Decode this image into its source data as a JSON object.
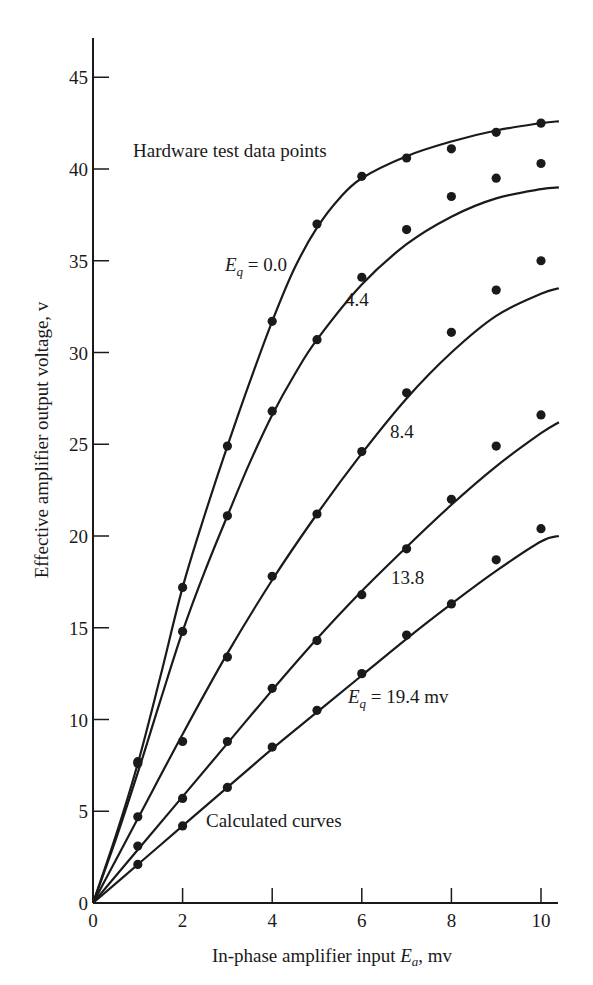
{
  "chart_data": {
    "type": "line",
    "title": "",
    "xlabel": "In-phase amplifier input E_a, mv",
    "xlabel_parts": {
      "pre": "In-phase amplifier input ",
      "var": "E",
      "sub": "a",
      "post": ", mv"
    },
    "ylabel": "Effective amplifier output voltage, v",
    "xlim": [
      0,
      10.4
    ],
    "ylim": [
      0,
      47
    ],
    "x_ticks": [
      0,
      2,
      4,
      6,
      8,
      10
    ],
    "y_ticks": [
      0,
      5,
      10,
      15,
      20,
      25,
      30,
      35,
      40,
      45
    ],
    "grid": false,
    "annotations": [
      {
        "text": "Hardware test data points",
        "x": 133,
        "y": 157
      },
      {
        "text": "Calculated curves",
        "x": 206,
        "y": 827
      }
    ],
    "series": [
      {
        "name": "Eq = 0.0",
        "label": {
          "pre": "E",
          "sub": "q",
          "post": " = 0.0",
          "x": 225,
          "y": 271
        },
        "curve": [
          [
            0,
            0
          ],
          [
            0.5,
            3.6
          ],
          [
            1,
            7.6
          ],
          [
            1.5,
            12.3
          ],
          [
            2,
            17.2
          ],
          [
            2.5,
            21.2
          ],
          [
            3,
            24.9
          ],
          [
            3.5,
            28.4
          ],
          [
            4,
            31.7
          ],
          [
            4.5,
            34.6
          ],
          [
            5,
            36.8
          ],
          [
            5.5,
            38.4
          ],
          [
            6,
            39.5
          ],
          [
            7,
            40.7
          ],
          [
            8,
            41.5
          ],
          [
            9,
            42.1
          ],
          [
            10,
            42.5
          ],
          [
            10.4,
            42.6
          ]
        ],
        "points": [
          [
            1,
            7.7
          ],
          [
            2,
            17.2
          ],
          [
            3,
            24.9
          ],
          [
            4,
            31.7
          ],
          [
            5,
            37.0
          ],
          [
            6,
            39.6
          ],
          [
            7,
            40.6
          ],
          [
            8,
            41.1
          ],
          [
            9,
            42.0
          ],
          [
            10,
            42.5
          ]
        ]
      },
      {
        "name": "Eq = 4.4",
        "label": {
          "pre": "",
          "sub": "",
          "post": "4.4",
          "x": 345,
          "y": 306
        },
        "curve": [
          [
            0,
            0
          ],
          [
            0.5,
            3.4
          ],
          [
            1,
            7.1
          ],
          [
            1.5,
            11.0
          ],
          [
            2,
            14.8
          ],
          [
            2.5,
            18.1
          ],
          [
            3,
            21.1
          ],
          [
            3.5,
            24.0
          ],
          [
            4,
            26.6
          ],
          [
            4.5,
            28.8
          ],
          [
            5,
            30.7
          ],
          [
            6,
            33.7
          ],
          [
            7,
            35.9
          ],
          [
            8,
            37.4
          ],
          [
            9,
            38.4
          ],
          [
            10,
            38.9
          ],
          [
            10.4,
            39.0
          ]
        ],
        "points": [
          [
            1,
            4.7
          ],
          [
            2,
            14.8
          ],
          [
            3,
            21.1
          ],
          [
            4,
            26.8
          ],
          [
            5,
            30.7
          ],
          [
            6,
            34.1
          ],
          [
            7,
            36.7
          ],
          [
            8,
            38.5
          ],
          [
            9,
            39.5
          ],
          [
            10,
            40.3
          ]
        ]
      },
      {
        "name": "Eq = 8.4",
        "label": {
          "pre": "",
          "sub": "",
          "post": "8.4",
          "x": 390,
          "y": 438
        },
        "curve": [
          [
            0,
            0
          ],
          [
            1,
            4.6
          ],
          [
            2,
            9.2
          ],
          [
            3,
            13.6
          ],
          [
            4,
            17.6
          ],
          [
            5,
            21.2
          ],
          [
            6,
            24.5
          ],
          [
            7,
            27.5
          ],
          [
            8,
            30.0
          ],
          [
            9,
            32.0
          ],
          [
            10,
            33.2
          ],
          [
            10.4,
            33.5
          ]
        ],
        "points": [
          [
            1,
            3.1
          ],
          [
            2,
            8.8
          ],
          [
            3,
            13.4
          ],
          [
            4,
            17.8
          ],
          [
            5,
            21.2
          ],
          [
            6,
            24.6
          ],
          [
            7,
            27.8
          ],
          [
            8,
            31.1
          ],
          [
            9,
            33.4
          ],
          [
            10,
            35.0
          ]
        ]
      },
      {
        "name": "Eq = 13.8",
        "label": {
          "pre": "",
          "sub": "",
          "post": "13.8",
          "x": 391,
          "y": 584
        },
        "curve": [
          [
            0,
            0
          ],
          [
            1,
            2.9
          ],
          [
            2,
            5.8
          ],
          [
            3,
            8.7
          ],
          [
            4,
            11.6
          ],
          [
            5,
            14.4
          ],
          [
            6,
            17.0
          ],
          [
            7,
            19.4
          ],
          [
            8,
            21.7
          ],
          [
            9,
            23.8
          ],
          [
            10,
            25.6
          ],
          [
            10.4,
            26.2
          ]
        ],
        "points": [
          [
            1,
            7.6
          ],
          [
            2,
            5.7
          ],
          [
            3,
            8.8
          ],
          [
            4,
            11.7
          ],
          [
            5,
            14.3
          ],
          [
            6,
            16.8
          ],
          [
            7,
            19.3
          ],
          [
            8,
            22.0
          ],
          [
            9,
            24.9
          ],
          [
            10,
            26.6
          ]
        ]
      },
      {
        "name": "Eq = 19.4 mv",
        "label": {
          "pre": "E",
          "sub": "q",
          "post": " = 19.4  mv",
          "x": 348,
          "y": 703
        },
        "curve": [
          [
            0,
            0
          ],
          [
            1,
            2.1
          ],
          [
            2,
            4.2
          ],
          [
            3,
            6.3
          ],
          [
            4,
            8.4
          ],
          [
            5,
            10.4
          ],
          [
            6,
            12.4
          ],
          [
            7,
            14.4
          ],
          [
            8,
            16.3
          ],
          [
            9,
            18.1
          ],
          [
            10,
            19.7
          ],
          [
            10.4,
            20.0
          ]
        ],
        "points": [
          [
            1,
            2.1
          ],
          [
            2,
            4.2
          ],
          [
            3,
            6.3
          ],
          [
            4,
            8.5
          ],
          [
            5,
            10.5
          ],
          [
            6,
            12.5
          ],
          [
            7,
            14.6
          ],
          [
            8,
            16.3
          ],
          [
            9,
            18.7
          ],
          [
            10,
            20.4
          ]
        ]
      }
    ],
    "layout": {
      "origin_px": [
        93,
        903
      ],
      "px_per_x": 44.8,
      "px_per_y": 18.35,
      "x_axis_end_px": 558,
      "y_axis_top_px": 38,
      "ink": "#1a1a1a"
    }
  }
}
